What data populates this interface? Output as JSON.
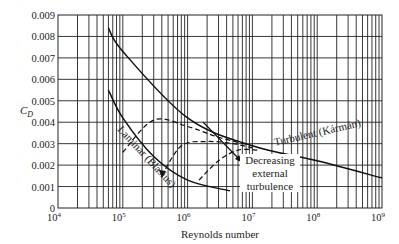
{
  "chart_data": {
    "type": "line",
    "title": "",
    "xlabel": "Reynolds number",
    "ylabel": "C_D",
    "xscale": "log",
    "xlim": [
      10000,
      1000000000
    ],
    "ylim": [
      0,
      0.009
    ],
    "grid": true,
    "x_tick_labels": [
      "10^4",
      "10^5",
      "10^6",
      "10^7",
      "10^8",
      "10^9"
    ],
    "y_tick_labels": [
      "0",
      "0.001",
      "0.002",
      "0.003",
      "0.004",
      "0.005",
      "0.006",
      "0.007",
      "0.008",
      "0.009"
    ],
    "series": [
      {
        "name": "Turbulent (Kármán)",
        "style": "solid",
        "x": [
          60000,
          100000,
          1000000,
          10000000,
          100000000,
          1000000000
        ],
        "values": [
          0.0084,
          0.0073,
          0.0042,
          0.0029,
          0.0022,
          0.0014
        ]
      },
      {
        "name": "Laminar (Blasius)",
        "style": "solid",
        "x": [
          60000,
          100000,
          300000,
          1000000,
          4500000
        ],
        "values": [
          0.0055,
          0.0042,
          0.0024,
          0.0013,
          0.0008
        ]
      },
      {
        "name": "Transition (low external turbulence)",
        "style": "dashed",
        "x": [
          100000,
          300000,
          1000000,
          3000000,
          10000000
        ],
        "values": [
          0.0026,
          0.0041,
          0.0038,
          0.0033,
          0.0029
        ]
      },
      {
        "name": "Transition (intermediate)",
        "style": "dashed",
        "x": [
          400000,
          800000,
          2000000,
          5000000,
          10000000
        ],
        "values": [
          0.0015,
          0.0029,
          0.0031,
          0.003,
          0.0028
        ]
      },
      {
        "name": "Transition (high external turbulence)",
        "style": "dashed",
        "x": [
          1500000,
          3000000,
          6000000,
          12000000
        ],
        "values": [
          0.0013,
          0.0022,
          0.0027,
          0.0027
        ]
      }
    ],
    "annotations": [
      {
        "text": "Turbulent (Kármán)",
        "anchor": "along upper solid curve near 10^7–10^8"
      },
      {
        "text": "Laminar (Blasius)",
        "anchor": "along lower solid curve near 10^5–10^6"
      },
      {
        "text": "Decreasing external turbulence",
        "anchor": "arrow pointing down-right across dashed transition curves near 10^6"
      }
    ]
  },
  "labels": {
    "y_axis": "C",
    "y_axis_sub": "D",
    "x_axis": "Reynolds number",
    "turbulent": "Turbulent (Kármán)",
    "laminar": "Laminar (Blasius)",
    "annotation_line1": "Decreasing",
    "annotation_line2": "external",
    "annotation_line3": "turbulence"
  },
  "ticks": {
    "x": [
      {
        "base": "10",
        "exp": "4"
      },
      {
        "base": "10",
        "exp": "5"
      },
      {
        "base": "10",
        "exp": "6"
      },
      {
        "base": "10",
        "exp": "7"
      },
      {
        "base": "10",
        "exp": "8"
      },
      {
        "base": "10",
        "exp": "9"
      }
    ],
    "y": [
      "0",
      "0.001",
      "0.002",
      "0.003",
      "0.004",
      "0.005",
      "0.006",
      "0.007",
      "0.008",
      "0.009"
    ]
  }
}
